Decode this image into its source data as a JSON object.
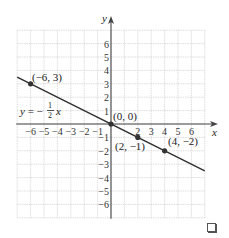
{
  "chart_data": {
    "type": "line",
    "title": "",
    "xlabel": "x",
    "ylabel": "y",
    "xlim": [
      -7,
      7
    ],
    "ylim": [
      -7,
      7
    ],
    "grid": true,
    "x_ticks": [
      "-6",
      "-5",
      "-4",
      "-3",
      "-2",
      "-1",
      "2",
      "3",
      "4",
      "5",
      "6"
    ],
    "y_ticks": [
      "6",
      "5",
      "4",
      "3",
      "2",
      "1",
      "-1",
      "-2",
      "-3",
      "-4",
      "-5",
      "-6"
    ],
    "series": [
      {
        "name": "y = -1/2 x",
        "equation": "y = -(1/2)x",
        "slope": -0.5,
        "intercept": 0,
        "x_range": [
          -7,
          7
        ],
        "color": "#333333"
      }
    ],
    "points": [
      {
        "x": -6,
        "y": 3,
        "label": "(-6, 3)"
      },
      {
        "x": 0,
        "y": 0,
        "label": "(0, 0)"
      },
      {
        "x": 2,
        "y": -1,
        "label": "(2, -1)"
      },
      {
        "x": 4,
        "y": -2,
        "label": "(4, -2)"
      }
    ],
    "annotations": [
      {
        "text": "y = -1/2 x",
        "near": [
          -6,
          1
        ]
      }
    ]
  },
  "labels": {
    "x_axis": "x",
    "y_axis": "y",
    "equation_prefix": "y = −",
    "equation_num": "1",
    "equation_den": "2",
    "equation_var": "x",
    "p1": "(−6, 3)",
    "p2": "(0, 0)",
    "p3": "(2, −1)",
    "p4": "(4, −2)"
  },
  "colors": {
    "grid": "#d0d0d0",
    "axis": "#444444",
    "line": "#333333",
    "point": "#333333"
  }
}
